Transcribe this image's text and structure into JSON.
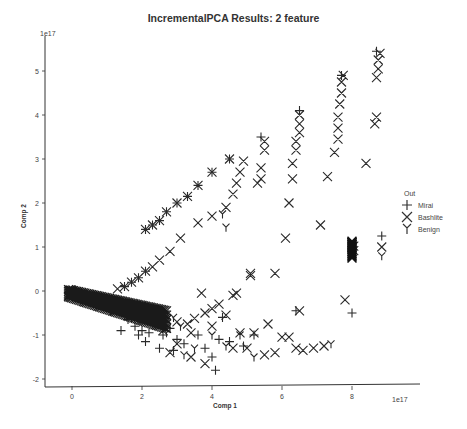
{
  "chart_data": {
    "type": "scatter",
    "title": "IncrementalPCA Results: 2 feature",
    "xlabel": "Comp 1",
    "ylabel": "Comp 2",
    "x_offset_label": "1e17",
    "y_offset_label": "1e17",
    "xlim": [
      -0.6,
      9.3
    ],
    "ylim": [
      -2.2,
      5.9
    ],
    "xticks": [
      0,
      2,
      4,
      6,
      8
    ],
    "yticks": [
      -2,
      -1,
      0,
      1,
      2,
      3,
      4,
      5
    ],
    "grid": false,
    "legend": {
      "title": "Out",
      "position": "right",
      "entries": [
        {
          "label": "Mirai",
          "marker": "+"
        },
        {
          "label": "Bashlite",
          "marker": "x"
        },
        {
          "label": "Benign",
          "marker": "Y"
        }
      ]
    },
    "series": [
      {
        "name": "Mirai",
        "marker": "+",
        "points": [
          [
            0.0,
            0.0
          ],
          [
            0.1,
            -0.05
          ],
          [
            0.2,
            -0.1
          ],
          [
            0.3,
            -0.15
          ],
          [
            0.4,
            -0.2
          ],
          [
            0.5,
            -0.25
          ],
          [
            0.6,
            -0.28
          ],
          [
            0.8,
            -0.32
          ],
          [
            1.0,
            -0.38
          ],
          [
            1.2,
            -0.42
          ],
          [
            1.4,
            -0.47
          ],
          [
            1.6,
            -0.5
          ],
          [
            1.8,
            -0.55
          ],
          [
            2.0,
            -0.58
          ],
          [
            2.2,
            -0.62
          ],
          [
            2.4,
            -0.66
          ],
          [
            2.6,
            -0.7
          ],
          [
            1.6,
            -0.65
          ],
          [
            1.8,
            -0.8
          ],
          [
            2.0,
            -0.9
          ],
          [
            2.2,
            -0.95
          ],
          [
            2.4,
            -0.75
          ],
          [
            2.6,
            -1.0
          ],
          [
            2.8,
            -0.85
          ],
          [
            3.0,
            -1.1
          ],
          [
            3.2,
            -1.2
          ],
          [
            1.4,
            -0.9
          ],
          [
            2.1,
            -1.15
          ],
          [
            2.5,
            -1.3
          ],
          [
            2.9,
            -1.35
          ],
          [
            3.6,
            -1.0
          ],
          [
            3.8,
            -1.3
          ],
          [
            4.0,
            -1.5
          ],
          [
            4.2,
            -1.1
          ],
          [
            4.1,
            -1.8
          ],
          [
            4.5,
            -1.15
          ],
          [
            4.9,
            -1.25
          ],
          [
            5.2,
            -1.0
          ],
          [
            4.3,
            -0.6
          ],
          [
            6.4,
            -0.45
          ],
          [
            8.0,
            -0.5
          ],
          [
            1.9,
            -1.0
          ],
          [
            2.1,
            1.4
          ],
          [
            2.3,
            1.5
          ],
          [
            2.5,
            1.6
          ],
          [
            2.7,
            1.8
          ],
          [
            3.0,
            2.0
          ],
          [
            3.3,
            2.15
          ],
          [
            3.6,
            2.4
          ],
          [
            4.0,
            2.7
          ],
          [
            4.5,
            3.0
          ],
          [
            5.4,
            3.5
          ],
          [
            6.5,
            4.1
          ],
          [
            7.7,
            4.9
          ],
          [
            8.7,
            5.45
          ],
          [
            1.5,
            0.1
          ],
          [
            1.7,
            0.2
          ],
          [
            1.9,
            0.3
          ],
          [
            2.1,
            0.45
          ],
          [
            8.85,
            1.25
          ]
        ]
      },
      {
        "name": "Bashlite",
        "marker": "x",
        "points": [
          [
            0.0,
            0.0
          ],
          [
            0.1,
            -0.03
          ],
          [
            0.25,
            -0.08
          ],
          [
            0.4,
            -0.15
          ],
          [
            0.6,
            -0.22
          ],
          [
            0.8,
            -0.3
          ],
          [
            1.0,
            -0.35
          ],
          [
            1.2,
            -0.4
          ],
          [
            1.5,
            -0.45
          ],
          [
            1.8,
            -0.5
          ],
          [
            2.1,
            -0.55
          ],
          [
            2.4,
            -0.6
          ],
          [
            2.7,
            -0.65
          ],
          [
            3.0,
            -0.7
          ],
          [
            3.3,
            -0.75
          ],
          [
            3.5,
            -0.62
          ],
          [
            3.8,
            -0.5
          ],
          [
            4.0,
            -0.4
          ],
          [
            4.2,
            -0.3
          ],
          [
            3.7,
            -0.05
          ],
          [
            4.6,
            -0.1
          ],
          [
            4.4,
            -0.55
          ],
          [
            4.0,
            -0.8
          ],
          [
            4.8,
            -0.95
          ],
          [
            5.2,
            -0.95
          ],
          [
            5.6,
            -0.75
          ],
          [
            6.0,
            -1.05
          ],
          [
            6.2,
            -1.05
          ],
          [
            3.4,
            -0.95
          ],
          [
            3.0,
            -1.2
          ],
          [
            2.6,
            -0.9
          ],
          [
            4.6,
            -1.3
          ],
          [
            5.0,
            -1.3
          ],
          [
            5.5,
            -1.45
          ],
          [
            5.8,
            -1.4
          ],
          [
            6.4,
            -1.3
          ],
          [
            6.6,
            -1.35
          ],
          [
            6.9,
            -1.3
          ],
          [
            7.2,
            -1.25
          ],
          [
            3.8,
            -1.65
          ],
          [
            2.8,
            -1.4
          ],
          [
            3.4,
            -1.5
          ],
          [
            1.3,
            0.05
          ],
          [
            1.5,
            0.1
          ],
          [
            1.7,
            0.2
          ],
          [
            1.9,
            0.3
          ],
          [
            2.1,
            0.45
          ],
          [
            2.3,
            0.55
          ],
          [
            2.5,
            0.7
          ],
          [
            2.8,
            0.9
          ],
          [
            3.1,
            1.2
          ],
          [
            3.6,
            1.55
          ],
          [
            4.0,
            1.7
          ],
          [
            4.4,
            1.9
          ],
          [
            4.6,
            2.2
          ],
          [
            4.7,
            2.45
          ],
          [
            4.8,
            2.7
          ],
          [
            4.9,
            2.95
          ],
          [
            2.1,
            1.4
          ],
          [
            2.3,
            1.5
          ],
          [
            2.5,
            1.6
          ],
          [
            2.7,
            1.8
          ],
          [
            3.0,
            2.0
          ],
          [
            3.3,
            2.15
          ],
          [
            3.6,
            2.4
          ],
          [
            4.0,
            2.7
          ],
          [
            4.5,
            3.0
          ],
          [
            5.3,
            2.45
          ],
          [
            5.4,
            2.55
          ],
          [
            5.4,
            2.8
          ],
          [
            5.5,
            3.4
          ],
          [
            5.5,
            3.2
          ],
          [
            5.1,
            0.4
          ],
          [
            5.1,
            0.35
          ],
          [
            4.7,
            -0.05
          ],
          [
            5.8,
            0.4
          ],
          [
            6.1,
            1.2
          ],
          [
            6.2,
            2.0
          ],
          [
            6.3,
            2.55
          ],
          [
            6.3,
            2.9
          ],
          [
            6.4,
            3.2
          ],
          [
            6.4,
            3.4
          ],
          [
            6.5,
            3.6
          ],
          [
            6.5,
            3.8
          ],
          [
            6.5,
            4.0
          ],
          [
            7.1,
            1.5
          ],
          [
            7.3,
            2.6
          ],
          [
            7.5,
            3.15
          ],
          [
            7.6,
            3.45
          ],
          [
            7.6,
            3.7
          ],
          [
            7.6,
            3.95
          ],
          [
            7.65,
            4.25
          ],
          [
            7.7,
            4.5
          ],
          [
            7.7,
            4.75
          ],
          [
            7.75,
            4.9
          ],
          [
            7.8,
            -0.2
          ],
          [
            8.4,
            2.9
          ],
          [
            8.65,
            3.8
          ],
          [
            8.7,
            3.95
          ],
          [
            8.7,
            4.85
          ],
          [
            8.75,
            5.05
          ],
          [
            8.75,
            5.25
          ],
          [
            8.8,
            5.4
          ],
          [
            8.0,
            0.85
          ],
          [
            8.0,
            0.9
          ],
          [
            8.0,
            0.95
          ],
          [
            8.0,
            1.0
          ],
          [
            8.0,
            1.05
          ],
          [
            8.0,
            1.1
          ],
          [
            8.05,
            0.92
          ],
          [
            8.05,
            1.02
          ],
          [
            8.85,
            1.0
          ],
          [
            6.5,
            -0.45
          ]
        ]
      },
      {
        "name": "Benign",
        "marker": "Y",
        "points": [
          [
            0.0,
            0.05
          ],
          [
            0.3,
            -0.1
          ],
          [
            0.7,
            -0.3
          ],
          [
            1.1,
            -0.45
          ],
          [
            1.7,
            -0.6
          ],
          [
            2.3,
            -0.7
          ],
          [
            2.7,
            -0.95
          ],
          [
            3.1,
            -0.8
          ],
          [
            3.5,
            -1.3
          ],
          [
            4.0,
            -1.0
          ],
          [
            4.4,
            -1.25
          ],
          [
            4.8,
            -1.0
          ],
          [
            5.2,
            -1.5
          ],
          [
            7.4,
            -1.2
          ],
          [
            8.85,
            0.8
          ],
          [
            4.4,
            1.45
          ],
          [
            4.3,
            1.75
          ],
          [
            3.2,
            -1.45
          ],
          [
            2.9,
            -0.6
          ],
          [
            8.0,
            0.95
          ]
        ]
      }
    ]
  }
}
